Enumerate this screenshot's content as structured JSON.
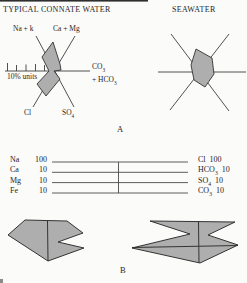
{
  "panel_a": {
    "section_label": "A",
    "connate": {
      "title": "TYPICAL CONNATE WATER",
      "axes": {
        "na_k": "Na + k",
        "ca_mg": "Ca + Mg",
        "co3_base": "CO",
        "co3_sub": "3",
        "hco3_base": "+ HCO",
        "hco3_sub": "3",
        "cl": "Cl",
        "so4_base": "SO",
        "so4_sub": "4",
        "scale_label": "10% units"
      }
    },
    "seawater": {
      "title": "SEAWATER"
    }
  },
  "panel_b": {
    "section_label": "B",
    "cation_scale": [
      {
        "ion": "Na",
        "value": "100"
      },
      {
        "ion": "Ca",
        "value": "10"
      },
      {
        "ion": "Mg",
        "value": "10"
      },
      {
        "ion": "Fe",
        "value": "10"
      }
    ],
    "anion_scale": [
      {
        "base": "Cl",
        "sub": "",
        "value": "100"
      },
      {
        "base": "HCO",
        "sub": "3",
        "value": "10"
      },
      {
        "base": "SO",
        "sub": "4",
        "value": "10"
      },
      {
        "base": "CO",
        "sub": "3",
        "value": "10"
      }
    ]
  },
  "colors": {
    "ink": "#262626",
    "line": "#3d3d3d",
    "shape_fill": "#aeaeae",
    "shape_stroke": "#333333",
    "background": "#fbfbfa"
  }
}
